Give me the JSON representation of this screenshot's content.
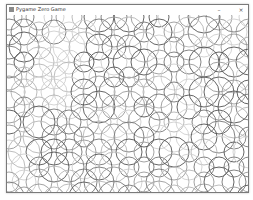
{
  "window": {
    "title": "Pygame Zero Game",
    "icon": "pygame-icon",
    "minimize_glyph": "–",
    "close_glyph": "×"
  },
  "canvas": {
    "background": "#ffffff",
    "pattern": "overlapping-circles",
    "grid_step": 15,
    "cols": 17,
    "rows": 13,
    "stroke_width": 0.9,
    "radius_set": [
      10,
      12,
      13,
      15,
      16
    ],
    "gray_set": [
      "#555555",
      "#777777",
      "#999999",
      "#b5b5b5",
      "#cfcfcf"
    ]
  }
}
